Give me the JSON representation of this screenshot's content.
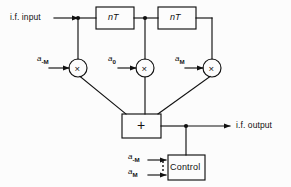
{
  "figure": {
    "type": "block-diagram",
    "background_color": "#fcfcfc",
    "line_color": "#111111"
  },
  "io": {
    "input_label": "i.f. input",
    "output_label": "i.f. output"
  },
  "delay_blocks": [
    {
      "label": "nT"
    },
    {
      "label": "nT"
    }
  ],
  "multipliers": [
    {
      "glyph": "×",
      "coefficient_base": "a",
      "coefficient_sub": "-M"
    },
    {
      "glyph": "×",
      "coefficient_base": "a",
      "coefficient_sub": "0"
    },
    {
      "glyph": "×",
      "coefficient_base": "a",
      "coefficient_sub": "M"
    }
  ],
  "summer": {
    "label": "+"
  },
  "control": {
    "label": "Control",
    "inputs": [
      {
        "base": "a",
        "sub": "-M"
      },
      {
        "base": "a",
        "sub": "M"
      }
    ],
    "between_marker": "vertical-dots"
  }
}
